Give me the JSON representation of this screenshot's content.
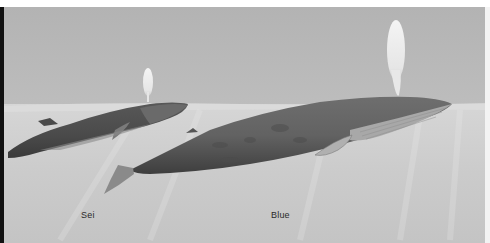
{
  "illustration": {
    "subject": "Sei whale and Blue whale surfacing",
    "palette": {
      "sky": "#b9b9b9",
      "water": "#cdcdcd",
      "whale_dark": "#4a4a4a",
      "whale_mid": "#6c6c6c",
      "belly_light": "#a9a9a9",
      "spout": "#efefef",
      "border_left": "#111111",
      "border_top": "#ffffff"
    }
  },
  "labels": {
    "sei": "Sei",
    "blue": "Blue"
  }
}
